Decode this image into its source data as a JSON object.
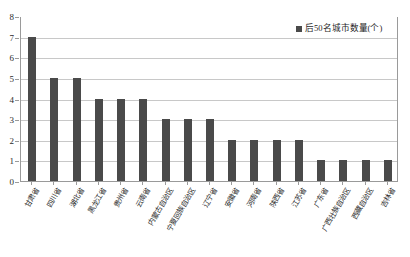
{
  "chart_data": {
    "type": "bar",
    "title": "",
    "subtitle": "",
    "xlabel": "",
    "ylabel": "",
    "ylim": [
      0,
      8
    ],
    "ytick_step": 1,
    "ytick_labels": [
      "0",
      "1",
      "2",
      "3",
      "4",
      "5",
      "6",
      "7",
      "8"
    ],
    "grid": true,
    "legend_position": "top-right",
    "legend": [
      "后50名城市数量(个)"
    ],
    "categories": [
      "甘肃省",
      "四川省",
      "湖北省",
      "黑龙江省",
      "贵州省",
      "云南省",
      "内蒙古自治区",
      "宁夏回族自治区",
      "辽宁省",
      "安徽省",
      "河南省",
      "陕西省",
      "江苏省",
      "广东省",
      "广西壮族自治区",
      "西藏自治区",
      "吉林省"
    ],
    "values": [
      7,
      5,
      5,
      4,
      4,
      4,
      3,
      3,
      3,
      2,
      2,
      2,
      2,
      1,
      1,
      1,
      1
    ],
    "series": [
      {
        "name": "后50名城市数量(个)",
        "values": [
          7,
          5,
          5,
          4,
          4,
          4,
          3,
          3,
          3,
          2,
          2,
          2,
          2,
          1,
          1,
          1,
          1
        ]
      }
    ],
    "bar_color": "#4a4a4a",
    "gridline_color": "#c8c8c8",
    "axis_color": "#9a9a9a",
    "plot_background": "#ffffff"
  },
  "legend": {
    "label": "后50名城市数量(个)"
  }
}
